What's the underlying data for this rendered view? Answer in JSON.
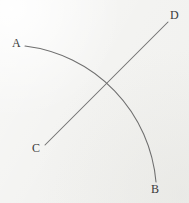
{
  "figure": {
    "title": "",
    "background_color": "#f3f3f1",
    "stroke_color": "#6e6e6e",
    "label_color": "#3a3a3a",
    "width": 189,
    "height": 203
  },
  "labels": {
    "a": "A",
    "b": "B",
    "c": "C",
    "d": "D"
  },
  "geometry": {
    "arc_AB": {
      "name": "arc-from-A-to-B",
      "type": "arc",
      "start": [
        25,
        46
      ],
      "end": [
        156,
        182
      ],
      "radius": 150,
      "sweep": "clockwise",
      "path": "M 25 46 A 150 150 0 0 1 156 182"
    },
    "line_CD": {
      "name": "line-from-C-to-D",
      "type": "line",
      "start": [
        45,
        145
      ],
      "end": [
        168,
        22
      ],
      "path": "M 45 145 L 168 22"
    },
    "intersection": [
      114,
      84
    ]
  }
}
